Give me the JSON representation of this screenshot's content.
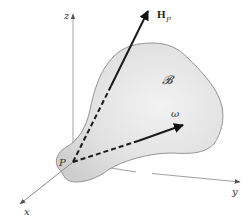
{
  "diagram": {
    "title": "",
    "axes": {
      "x_label": "x",
      "y_label": "y",
      "z_label": "z"
    },
    "origin_label": "P",
    "body_label": "𝓑",
    "vectors": {
      "angular_momentum": {
        "label_main": "H",
        "label_sub": "P"
      },
      "angular_velocity": {
        "label": "ω"
      }
    },
    "colors": {
      "body_fill": "#dcdcdc",
      "body_stroke": "#8a8a8a",
      "axis": "#9a9a9a",
      "vector": "#1a1a1a"
    }
  }
}
